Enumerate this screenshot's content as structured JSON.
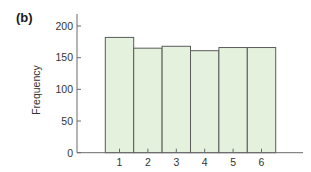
{
  "panel_label": "(b)",
  "colors": {
    "bar_fill": "#e4f2dd",
    "bar_stroke": "#5a5a5a",
    "axis": "#6a6a6a",
    "text": "#333333"
  },
  "chart_data": {
    "type": "bar",
    "title": "",
    "xlabel": "",
    "ylabel": "Frequency",
    "categories": [
      "1",
      "2",
      "3",
      "4",
      "5",
      "6"
    ],
    "values": [
      182,
      165,
      168,
      161,
      166,
      166
    ],
    "ylim": [
      0,
      200
    ],
    "yticks": [
      0,
      50,
      100,
      150,
      200
    ],
    "ytick_labels": [
      "0",
      "50",
      "100",
      "150",
      "200"
    ],
    "grid": false,
    "legend": null,
    "bar_width": "full (bars touch, histogram style)"
  }
}
